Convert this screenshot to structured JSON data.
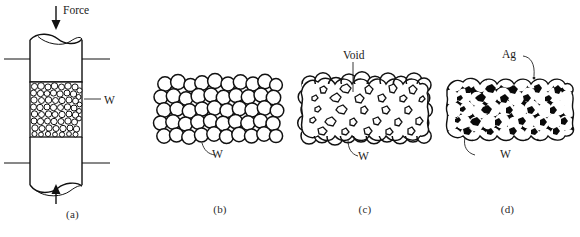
{
  "figure": {
    "background_color": "#ffffff",
    "line_color": "#111111",
    "fill_color": "#0a0a0a"
  },
  "panels": [
    {
      "id": "a",
      "caption": "(a)",
      "description": "Powder pressed in a die between two punches",
      "labels": [
        {
          "name": "force",
          "text": "Force"
        },
        {
          "name": "tungsten",
          "text": "W"
        }
      ]
    },
    {
      "id": "b",
      "caption": "(b)",
      "description": "Loose packed spherical tungsten particles",
      "labels": [
        {
          "name": "tungsten",
          "text": "W"
        }
      ]
    },
    {
      "id": "c",
      "caption": "(c)",
      "description": "Sintered tungsten skeleton with voids",
      "labels": [
        {
          "name": "void",
          "text": "Void"
        },
        {
          "name": "tungsten",
          "text": "W"
        }
      ]
    },
    {
      "id": "d",
      "caption": "(d)",
      "description": "Voids infiltrated with silver",
      "labels": [
        {
          "name": "silver",
          "text": "Ag"
        },
        {
          "name": "tungsten",
          "text": "W"
        }
      ]
    }
  ],
  "labels": {
    "force": "Force",
    "tungsten": "W",
    "void": "Void",
    "silver": "Ag"
  },
  "captions": {
    "a": "(a)",
    "b": "(b)",
    "c": "(c)",
    "d": "(d)"
  }
}
